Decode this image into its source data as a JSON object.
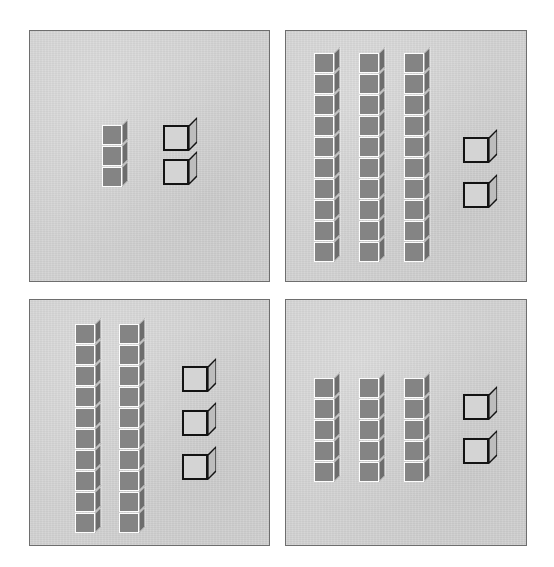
{
  "worksheet": {
    "title": "Base-Ten Blocks Place Value Panels",
    "background_color": "#ffffff",
    "panel_background_color": "#d2d2d2",
    "panel_border_color": "#6e6e6e",
    "rod_cube_front_color": "#848484",
    "rod_cube_top_color": "#a6a6a6",
    "rod_cube_side_color": "#6d6d6d",
    "rod_cube_outline_color": "#fdfdfd",
    "unit_cube_fill_color": "#d4d4d4",
    "unit_cube_outline_color": "#131313"
  },
  "panels": [
    {
      "id": "panel-1",
      "position": "top-left",
      "rods": [
        {
          "cubes": 3,
          "x": 72,
          "y": 88
        }
      ],
      "units": [
        {
          "x": 133,
          "y": 86
        },
        {
          "x": 133,
          "y": 120
        }
      ],
      "rod_count": 1,
      "rod_length": 3,
      "unit_count": 2,
      "total_cubes": 5
    },
    {
      "id": "panel-2",
      "position": "top-right",
      "rods": [
        {
          "cubes": 10,
          "x": 28,
          "y": 16
        },
        {
          "cubes": 10,
          "x": 73,
          "y": 16
        },
        {
          "cubes": 10,
          "x": 118,
          "y": 16
        }
      ],
      "units": [
        {
          "x": 177,
          "y": 98
        },
        {
          "x": 177,
          "y": 143
        }
      ],
      "rod_count": 3,
      "rod_length": 10,
      "unit_count": 2,
      "total_cubes": 32
    },
    {
      "id": "panel-3",
      "position": "bottom-left",
      "rods": [
        {
          "cubes": 10,
          "x": 45,
          "y": 18
        },
        {
          "cubes": 10,
          "x": 89,
          "y": 18
        }
      ],
      "units": [
        {
          "x": 152,
          "y": 58
        },
        {
          "x": 152,
          "y": 102
        },
        {
          "x": 152,
          "y": 146
        }
      ],
      "rod_count": 2,
      "rod_length": 10,
      "unit_count": 3,
      "total_cubes": 23
    },
    {
      "id": "panel-4",
      "position": "bottom-right",
      "rods": [
        {
          "cubes": 5,
          "x": 28,
          "y": 72
        },
        {
          "cubes": 5,
          "x": 73,
          "y": 72
        },
        {
          "cubes": 5,
          "x": 118,
          "y": 72
        }
      ],
      "units": [
        {
          "x": 177,
          "y": 86
        },
        {
          "x": 177,
          "y": 130
        }
      ],
      "rod_count": 3,
      "rod_length": 5,
      "unit_count": 2,
      "total_cubes": 17
    }
  ]
}
